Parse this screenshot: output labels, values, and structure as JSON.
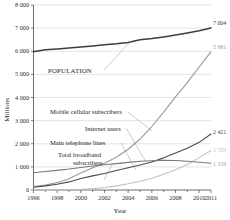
{
  "chart_data": {
    "type": "line",
    "title": "",
    "xlabel": "Year",
    "ylabel": "Millions",
    "xlim": [
      1996,
      2011
    ],
    "ylim": [
      0,
      8000
    ],
    "grid": true,
    "legend_position": "in-plot-labels",
    "x": [
      1996,
      1997,
      1998,
      1999,
      2000,
      2001,
      2002,
      2003,
      2004,
      2005,
      2006,
      2007,
      2008,
      2009,
      2010,
      2011
    ],
    "y_ticks": [
      "0",
      "1 000",
      "2 000",
      "3 000",
      "4 000",
      "5 000",
      "6 000",
      "7 000",
      "8 000"
    ],
    "y_tick_values": [
      0,
      1000,
      2000,
      3000,
      4000,
      5000,
      6000,
      7000,
      8000
    ],
    "x_ticks": [
      "1996",
      "1998",
      "2000",
      "2002",
      "2004",
      "2006",
      "2008",
      "2010",
      "2011"
    ],
    "x_tick_values": [
      1996,
      1998,
      2000,
      2002,
      2004,
      2006,
      2008,
      2010,
      2011
    ],
    "series": [
      {
        "name": "POPULATION",
        "label": "POPULATION",
        "color": "#3d3d3d",
        "width": 1.5,
        "end_value_text": "7 004",
        "end_value": 7004,
        "values": [
          5980,
          6060,
          6100,
          6140,
          6180,
          6230,
          6280,
          6320,
          6380,
          6500,
          6550,
          6620,
          6700,
          6790,
          6890,
          7004
        ]
      },
      {
        "name": "Mobile cellular subscribers",
        "label": "Mobile cellular subscribers",
        "color": "#9a9a9a",
        "width": 1.1,
        "end_value_text": "5 981",
        "end_value": 5981,
        "values": [
          145,
          215,
          318,
          490,
          738,
          961,
          1158,
          1417,
          1763,
          2205,
          2745,
          3368,
          4030,
          4640,
          5320,
          5981
        ]
      },
      {
        "name": "Internet users",
        "label": "Internet users",
        "color": "#4a4a4a",
        "width": 1.1,
        "end_value_text": "2 421",
        "end_value": 2421,
        "values": [
          120,
          180,
          250,
          350,
          495,
          610,
          715,
          840,
          960,
          1080,
          1210,
          1390,
          1600,
          1810,
          2060,
          2421
        ]
      },
      {
        "name": "Total broadband subscribers",
        "label": "Total broadband subscribers",
        "color": "#c2c2c2",
        "width": 1.1,
        "end_value_text": "1 709",
        "end_value": 1709,
        "values": [
          0,
          2,
          6,
          14,
          30,
          60,
          110,
          180,
          270,
          380,
          510,
          680,
          880,
          1100,
          1400,
          1709
        ]
      },
      {
        "name": "Main telephone lines",
        "label": "Main telephone lines",
        "color": "#787878",
        "width": 1.1,
        "end_value_text": "1 159",
        "end_value": 1159,
        "values": [
          745,
          800,
          850,
          905,
          975,
          1040,
          1090,
          1140,
          1195,
          1240,
          1265,
          1280,
          1275,
          1240,
          1200,
          1159
        ]
      }
    ],
    "annotations": [
      {
        "text": "POPULATION",
        "series": "POPULATION"
      },
      {
        "text": "Mobile cellular subscribers",
        "series": "Mobile cellular subscribers"
      },
      {
        "text": "Internet users",
        "series": "Internet users"
      },
      {
        "text": "Main telephone lines",
        "series": "Main telephone lines"
      },
      {
        "text": "Total broadband",
        "series": "Total broadband subscribers"
      },
      {
        "text": "subscribers",
        "series": "Total broadband subscribers"
      }
    ]
  },
  "labels": {
    "y_axis_title": "Millions",
    "x_axis_title": "Year",
    "population": "POPULATION",
    "mobile": "Mobile cellular subscribers",
    "internet": "Internet users",
    "telephone": "Main telephone lines",
    "broadband_line1": "Total broadband",
    "broadband_line2": "subscribers"
  },
  "y_tick_labels": {
    "t0": "0",
    "t1": "1 000",
    "t2": "2 000",
    "t3": "3 000",
    "t4": "4 000",
    "t5": "5 000",
    "t6": "6 000",
    "t7": "7 000",
    "t8": "8 000"
  },
  "x_tick_labels": {
    "t1996": "1996",
    "t1998": "1998",
    "t2000": "2000",
    "t2002": "2002",
    "t2004": "2004",
    "t2006": "2006",
    "t2008": "2008",
    "t2010": "2010",
    "t2011": "2011"
  },
  "end_values": {
    "population": "7 004",
    "mobile": "5 981",
    "internet": "2 421",
    "broadband": "1 709",
    "telephone": "1 159"
  },
  "colors": {
    "population": "#3d3d3d",
    "mobile": "#9a9a9a",
    "internet": "#4a4a4a",
    "broadband": "#c2c2c2",
    "telephone": "#787878",
    "grid": "#c9c9c9",
    "axis": "#4a4a4a",
    "text": "#1d1d1d",
    "background": "#ffffff"
  }
}
